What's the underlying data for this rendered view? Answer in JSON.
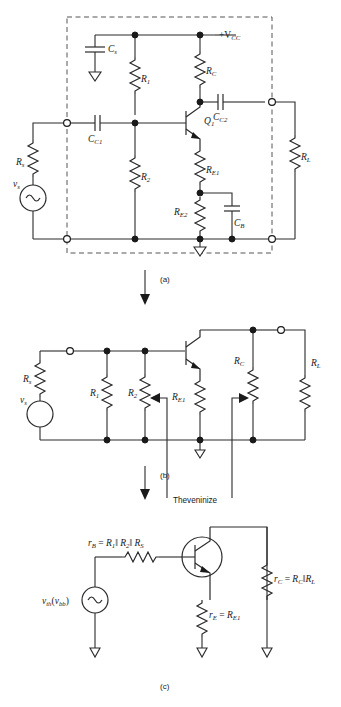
{
  "figure": {
    "captions": {
      "a": "(a)",
      "b": "(b)",
      "c": "(c)"
    },
    "annotation": {
      "theveninize": "Theveninize"
    }
  },
  "circuit_a": {
    "caption": "(a)",
    "supply_label": "+V",
    "supply_sub": "CC",
    "components": [
      {
        "name": "bypass-cap-supply",
        "base": "C",
        "sub": "s",
        "type": "capacitor"
      },
      {
        "name": "bias-resistor-top",
        "base": "R",
        "sub": "1",
        "type": "resistor"
      },
      {
        "name": "collector-resistor",
        "base": "R",
        "sub": "C",
        "type": "resistor"
      },
      {
        "name": "input-coupling-cap",
        "base": "C",
        "sub": "C1",
        "type": "capacitor"
      },
      {
        "name": "output-coupling-cap",
        "base": "C",
        "sub": "C2",
        "type": "capacitor"
      },
      {
        "name": "bias-resistor-bottom",
        "base": "R",
        "sub": "2",
        "type": "resistor"
      },
      {
        "name": "emitter-resistor-1",
        "base": "R",
        "sub": "E1",
        "type": "resistor"
      },
      {
        "name": "emitter-resistor-2",
        "base": "R",
        "sub": "E2",
        "type": "resistor"
      },
      {
        "name": "bypass-cap-emitter",
        "base": "C",
        "sub": "B",
        "type": "capacitor"
      },
      {
        "name": "source-resistor",
        "base": "R",
        "sub": "s",
        "type": "resistor"
      },
      {
        "name": "load-resistor",
        "base": "R",
        "sub": "L",
        "type": "resistor"
      },
      {
        "name": "transistor",
        "base": "Q",
        "sub": "1",
        "type": "npn-transistor"
      },
      {
        "name": "source-voltage",
        "base": "v",
        "sub": "s",
        "type": "ac-source"
      }
    ]
  },
  "circuit_b": {
    "caption": "(b)",
    "components": [
      {
        "name": "source-resistor",
        "base": "R",
        "sub": "s",
        "type": "resistor"
      },
      {
        "name": "source-voltage",
        "base": "v",
        "sub": "s",
        "type": "ac-source"
      },
      {
        "name": "bias-resistor-top",
        "base": "R",
        "sub": "1",
        "type": "resistor"
      },
      {
        "name": "bias-resistor-bottom",
        "base": "R",
        "sub": "2",
        "type": "resistor"
      },
      {
        "name": "emitter-resistor-1",
        "base": "R",
        "sub": "E1",
        "type": "resistor"
      },
      {
        "name": "collector-resistor",
        "base": "R",
        "sub": "C",
        "type": "resistor"
      },
      {
        "name": "load-resistor",
        "base": "R",
        "sub": "L",
        "type": "resistor"
      }
    ],
    "annotation": "Theveninize"
  },
  "circuit_c": {
    "caption": "(c)",
    "base_resistance": {
      "lhs": "r",
      "lhs_sub": "B",
      "rhs": "= R₁ ‖ R₂ ‖ R",
      "rhs_sub": "S"
    },
    "base_resistance_full": "r_B = R₁ ‖ R₂ ‖ R_S",
    "emitter_resistance_full": "r_E = R_E1",
    "collector_resistance_full": "r_C = R_C ‖ R_L",
    "source_label_full": "v_th(v_bb)",
    "labels": {
      "rb_main": "r",
      "rb_sub": "B",
      "rb_eq": "= R",
      "re_main": "r",
      "re_sub": "E",
      "rc_main": "r",
      "rc_sub": "C",
      "vth_main": "v",
      "vth_sub": "th",
      "vth_paren_open": "(v",
      "vth_paren_sub": "bb",
      "vth_paren_close": ")"
    }
  },
  "colors": {
    "wire": "#2a2a2a",
    "dashed_box": "#555555",
    "background": "#ffffff",
    "text": "#1a1a1a"
  }
}
